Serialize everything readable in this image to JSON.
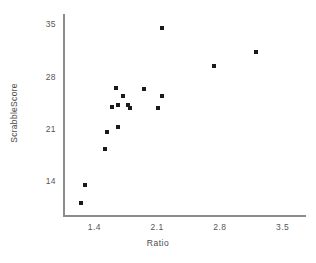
{
  "chart_data": {
    "type": "scatter",
    "title": "",
    "xlabel": "Ratio",
    "ylabel": "ScrabbleScore",
    "xlim": [
      1.05,
      3.75
    ],
    "ylim": [
      9.5,
      36.5
    ],
    "xticks": [
      "1.4",
      "2.1",
      "2.8",
      "3.5"
    ],
    "xtick_values": [
      1.4,
      2.1,
      2.8,
      3.5
    ],
    "yticks": [
      "35",
      "28",
      "21",
      "14"
    ],
    "ytick_values": [
      35,
      28,
      21,
      14
    ],
    "grid": false,
    "legend": false,
    "legend_position": "none",
    "marker": "square",
    "marker_color": "#1a1a1a",
    "axis_color": "#8b8b8b",
    "points": [
      {
        "x": 1.29,
        "y": 13.7
      },
      {
        "x": 1.25,
        "y": 11.2
      },
      {
        "x": 1.54,
        "y": 20.7
      },
      {
        "x": 1.52,
        "y": 18.5
      },
      {
        "x": 1.66,
        "y": 21.4
      },
      {
        "x": 1.64,
        "y": 26.6
      },
      {
        "x": 1.66,
        "y": 24.3
      },
      {
        "x": 1.72,
        "y": 25.5
      },
      {
        "x": 1.78,
        "y": 24.3
      },
      {
        "x": 1.8,
        "y": 23.9
      },
      {
        "x": 1.95,
        "y": 26.5
      },
      {
        "x": 2.15,
        "y": 25.5
      },
      {
        "x": 2.11,
        "y": 23.9
      },
      {
        "x": 2.15,
        "y": 34.6
      },
      {
        "x": 2.73,
        "y": 29.6
      },
      {
        "x": 3.2,
        "y": 31.4
      },
      {
        "x": 1.6,
        "y": 24.1
      }
    ]
  }
}
